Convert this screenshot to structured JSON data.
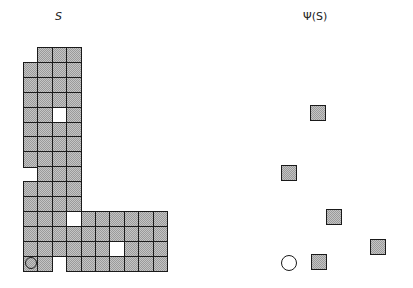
{
  "left_panel": {
    "title": "S",
    "grid": {
      "origin_x": 23,
      "origin_y": 47,
      "cell_w": 14.4,
      "cell_h": 14.9,
      "cols": 10,
      "rows": 15,
      "rows_map": [
        "-###------",
        "####------",
        "####------",
        "####------",
        "##W#------",
        "####------",
        "####------",
        "####------",
        "-###------",
        "####------",
        "####------",
        "###W######",
        "##########",
        "######W###",
        "O#-#######"
      ],
      "legend": {
        "#": "shaded cell",
        "W": "white cell (hole)",
        "-": "empty",
        "O": "shaded cell with circle marker"
      }
    }
  },
  "right_panel": {
    "title": "Ψ(S)",
    "squares": [
      {
        "x": 310,
        "y": 105,
        "size": 16
      },
      {
        "x": 281,
        "y": 165,
        "size": 16
      },
      {
        "x": 326,
        "y": 209,
        "size": 16
      },
      {
        "x": 370,
        "y": 239,
        "size": 16
      },
      {
        "x": 311,
        "y": 254,
        "size": 16
      }
    ],
    "circle": {
      "cx": 289,
      "cy": 263,
      "r": 8
    }
  },
  "colors": {
    "outline": "#1a1a1a",
    "fill_light": "#c4c4c4",
    "fill_dark": "#9a9a9a",
    "background": "#ffffff"
  }
}
